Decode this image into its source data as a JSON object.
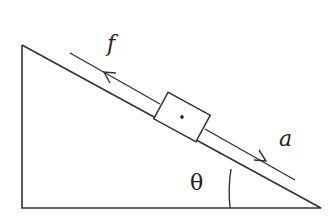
{
  "diagram": {
    "labels": {
      "friction": "f",
      "acceleration": "a",
      "angle": "θ"
    },
    "colors": {
      "stroke": "#333333",
      "background": "#ffffff"
    }
  }
}
